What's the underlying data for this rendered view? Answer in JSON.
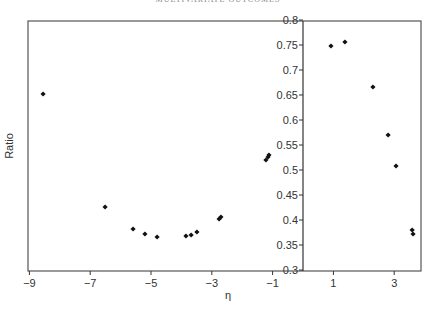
{
  "page": {
    "running_header": "MULTIVARIATE OUTCOMES"
  },
  "chart_data": {
    "type": "scatter",
    "title": "",
    "xlabel": "η",
    "ylabel": "Ratio",
    "xlim": [
      -9,
      4
    ],
    "ylim": [
      0.3,
      0.8
    ],
    "grid": false,
    "legend": null,
    "x_ticks": [
      "−9",
      "−7",
      "−5",
      "−3",
      "−1",
      "1",
      "3"
    ],
    "x_tick_values": [
      -9,
      -7,
      -5,
      -3,
      -1,
      1,
      3
    ],
    "y_ticks": [
      "0.3",
      "0.35",
      "0.4",
      "0.45",
      "0.5",
      "0.55",
      "0.6",
      "0.65",
      "0.7",
      "0.75",
      "0.8"
    ],
    "y_tick_values": [
      0.3,
      0.35,
      0.4,
      0.45,
      0.5,
      0.55,
      0.6,
      0.65,
      0.7,
      0.75,
      0.8
    ],
    "y_axis_position": "x=0 (centered)",
    "marker": "diamond",
    "series": [
      {
        "name": "Ratio",
        "x": [
          -8.55,
          -6.51,
          -5.59,
          -5.2,
          -4.8,
          -3.85,
          -3.68,
          -3.49,
          -2.76,
          -2.7,
          -1.22,
          -1.15,
          -1.12,
          0.92,
          1.38,
          2.3,
          2.8,
          3.06,
          3.59,
          3.62
        ],
        "y": [
          0.652,
          0.426,
          0.382,
          0.372,
          0.366,
          0.368,
          0.37,
          0.376,
          0.402,
          0.406,
          0.52,
          0.526,
          0.53,
          0.748,
          0.756,
          0.666,
          0.57,
          0.508,
          0.38,
          0.372
        ]
      }
    ]
  }
}
